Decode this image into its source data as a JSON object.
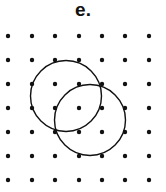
{
  "figure": {
    "label": "e.",
    "grid": {
      "columns_x": [
        8,
        32,
        55,
        79,
        102,
        125,
        149
      ],
      "rows_y": [
        36,
        60,
        84,
        108,
        132,
        156,
        180
      ],
      "dot_radius": 2.2,
      "dot_color": "#111111"
    },
    "circles": [
      {
        "cx": 66,
        "cy": 96,
        "r": 35.5,
        "stroke": "#111111"
      },
      {
        "cx": 90,
        "cy": 120,
        "r": 35.5,
        "stroke": "#111111"
      }
    ]
  }
}
